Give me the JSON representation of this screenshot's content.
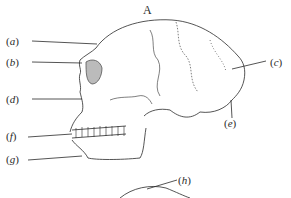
{
  "figure": {
    "title": "A",
    "labels": [
      {
        "id": "a",
        "text": "a"
      },
      {
        "id": "b",
        "text": "b"
      },
      {
        "id": "c",
        "text": "c"
      },
      {
        "id": "d",
        "text": "d"
      },
      {
        "id": "e",
        "text": "e"
      },
      {
        "id": "f",
        "text": "f"
      },
      {
        "id": "g",
        "text": "g"
      },
      {
        "id": "h",
        "text": "h"
      }
    ],
    "colors": {
      "ink": "#2a2a2a",
      "background": "#ffffff",
      "stipple": "#777777"
    }
  }
}
